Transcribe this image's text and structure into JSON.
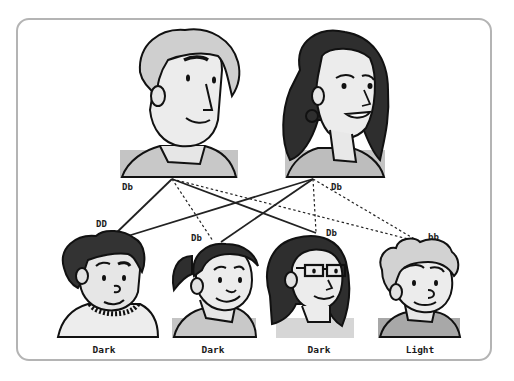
{
  "parents": [
    {
      "id": "father",
      "genotype": "Db",
      "hair": "light"
    },
    {
      "id": "mother",
      "genotype": "Db",
      "hair": "dark"
    }
  ],
  "children": [
    {
      "id": "child-1",
      "genotype": "DD",
      "phenotype": "Dark"
    },
    {
      "id": "child-2",
      "genotype": "Db",
      "phenotype": "Dark"
    },
    {
      "id": "child-3",
      "genotype": "Db",
      "phenotype": "Dark"
    },
    {
      "id": "child-4",
      "genotype": "bb",
      "phenotype": "Light"
    }
  ],
  "edges": [
    {
      "from": "father",
      "to": "child-1",
      "style": "solid"
    },
    {
      "from": "father",
      "to": "child-2",
      "style": "dashed"
    },
    {
      "from": "father",
      "to": "child-3",
      "style": "solid"
    },
    {
      "from": "father",
      "to": "child-4",
      "style": "dashed"
    },
    {
      "from": "mother",
      "to": "child-1",
      "style": "solid"
    },
    {
      "from": "mother",
      "to": "child-2",
      "style": "solid"
    },
    {
      "from": "mother",
      "to": "child-3",
      "style": "dashed"
    },
    {
      "from": "mother",
      "to": "child-4",
      "style": "dashed"
    }
  ],
  "colors": {
    "line": "#222222",
    "frame": "#b4b4b4",
    "skin": "#e8e8e8",
    "dark_hair": "#3a3a3a",
    "light_hair": "#c8c8c8",
    "shirt": "#bdbdbd"
  }
}
